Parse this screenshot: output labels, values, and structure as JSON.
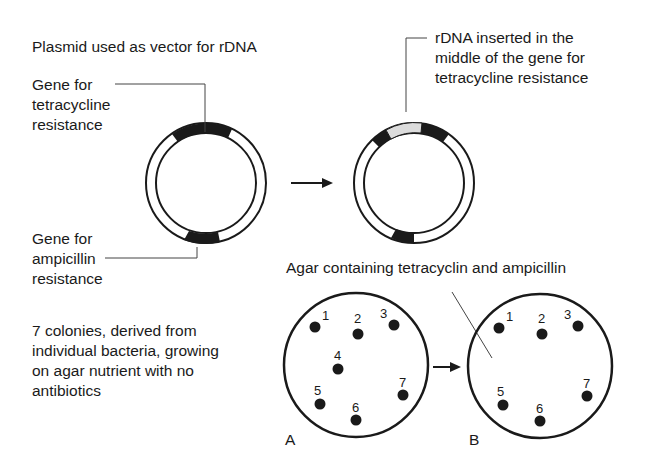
{
  "title": "Plasmid used as vector for rDNA",
  "plasmid_original": {
    "tet_label": [
      "Gene for",
      "tetracycline",
      "resistance"
    ],
    "amp_label": [
      "Gene for",
      "ampicillin",
      "resistance"
    ]
  },
  "plasmid_recombinant": {
    "insert_label": [
      "rDNA inserted in the",
      "middle of the gene for",
      "tetracycline resistance"
    ]
  },
  "plate_caption": "Agar containing tetracyclin and ampicillin",
  "colonies_label": [
    "7 colonies, derived from",
    "individual bacteria, growing",
    "on agar nutrient with no",
    "antibiotics"
  ],
  "plate_a": {
    "label": "A",
    "colonies": [
      "1",
      "2",
      "3",
      "4",
      "5",
      "6",
      "7"
    ]
  },
  "plate_b": {
    "label": "B",
    "colonies": [
      "1",
      "2",
      "3",
      "5",
      "6",
      "7"
    ]
  },
  "colors": {
    "ink": "#1a1a1a",
    "insert": "#dcdcdc",
    "background": "#ffffff"
  }
}
